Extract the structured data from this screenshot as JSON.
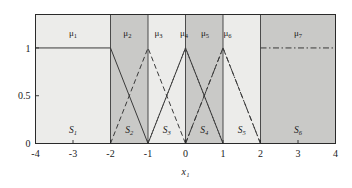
{
  "chart_data": {
    "type": "line",
    "title": "",
    "xlabel": "x₁",
    "ylabel": "",
    "xlim": [
      -4,
      4
    ],
    "ylim": [
      0,
      1.35
    ],
    "grid": false,
    "legend_position": "none",
    "x_ticks": [
      "-4",
      "-3",
      "-2",
      "-1",
      "0",
      "1",
      "2",
      "3",
      "4"
    ],
    "x_tick_values": [
      -4,
      -3,
      -2,
      -1,
      0,
      1,
      2,
      3,
      4
    ],
    "y_ticks": [
      "0",
      "0.5",
      "1"
    ],
    "y_tick_values": [
      0,
      0.5,
      1
    ],
    "series": [
      {
        "name": "μ₁",
        "label": "μ",
        "sub": "1",
        "style": "solid",
        "points": [
          [
            -4,
            1
          ],
          [
            -2,
            1
          ],
          [
            -1,
            0
          ]
        ]
      },
      {
        "name": "μ₂",
        "label": "μ",
        "sub": "2",
        "style": "dashed",
        "points": [
          [
            -2,
            0
          ],
          [
            -1,
            1
          ],
          [
            0,
            0
          ]
        ]
      },
      {
        "name": "μ₃",
        "label": "μ",
        "sub": "3",
        "style": "dotted",
        "points": [
          [
            -1,
            0
          ],
          [
            0,
            1
          ],
          [
            1,
            0
          ]
        ]
      },
      {
        "name": "μ₄",
        "label": "μ",
        "sub": "4",
        "style": "solid",
        "points": [
          [
            -1,
            0
          ],
          [
            0,
            1
          ],
          [
            1,
            0
          ]
        ]
      },
      {
        "name": "μ₅",
        "label": "μ",
        "sub": "5",
        "style": "dashdot",
        "points": [
          [
            0,
            0
          ],
          [
            1,
            1
          ],
          [
            2,
            0
          ]
        ]
      },
      {
        "name": "μ₆",
        "label": "μ",
        "sub": "6",
        "style": "dashed",
        "points": [
          [
            0,
            0
          ],
          [
            1,
            1
          ],
          [
            2,
            0
          ]
        ]
      },
      {
        "name": "μ₇",
        "label": "μ",
        "sub": "7",
        "style": "dashdot",
        "points": [
          [
            2,
            1
          ],
          [
            4,
            1
          ]
        ]
      }
    ],
    "regions": [
      {
        "name": "S₁",
        "label": "S",
        "sub": "1",
        "x0": -4,
        "x1": -2,
        "shade": "light"
      },
      {
        "name": "S₂",
        "label": "S",
        "sub": "2",
        "x0": -2,
        "x1": -1,
        "shade": "dark"
      },
      {
        "name": "S₃",
        "label": "S",
        "sub": "3",
        "x0": -1,
        "x1": 0,
        "shade": "light"
      },
      {
        "name": "S₄",
        "label": "S",
        "sub": "4",
        "x0": 0,
        "x1": 1,
        "shade": "dark"
      },
      {
        "name": "S₅",
        "label": "S",
        "sub": "5",
        "x0": 1,
        "x1": 2,
        "shade": "light"
      },
      {
        "name": "S₆",
        "label": "S",
        "sub": "6",
        "x0": 2,
        "x1": 4,
        "shade": "dark"
      }
    ],
    "mu_label_positions": [
      {
        "name": "μ₁",
        "label": "μ",
        "sub": "1",
        "x": -3.0
      },
      {
        "name": "μ₂",
        "label": "μ",
        "sub": "2",
        "x": -1.55
      },
      {
        "name": "μ₃",
        "label": "μ",
        "sub": "3",
        "x": -0.72
      },
      {
        "name": "μ₄",
        "label": "μ",
        "sub": "4",
        "x": -0.04
      },
      {
        "name": "μ₅",
        "label": "μ",
        "sub": "5",
        "x": 0.52
      },
      {
        "name": "μ₆",
        "label": "μ",
        "sub": "6",
        "x": 1.12
      },
      {
        "name": "μ₇",
        "label": "μ",
        "sub": "7",
        "x": 3.0
      }
    ],
    "colors": {
      "shade_light": "#ececea",
      "shade_dark": "#c9c9c7",
      "line": "#3a3a3a",
      "axis": "#2a2a2a",
      "background": "#ffffff"
    }
  }
}
